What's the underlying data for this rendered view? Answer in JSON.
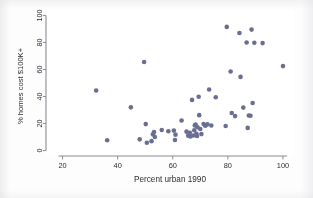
{
  "chart_data": {
    "type": "scatter",
    "title": "",
    "xlabel": "Percent urban 1990",
    "ylabel": "% homes cost $100K+",
    "xlim": [
      14,
      104
    ],
    "ylim": [
      -4,
      104
    ],
    "xticks": [
      20,
      40,
      60,
      80,
      100
    ],
    "yticks": [
      0,
      20,
      40,
      60,
      80,
      100
    ],
    "xtick_labels": [
      "20",
      "40",
      "60",
      "80",
      "100"
    ],
    "ytick_labels": [
      "0",
      "20",
      "40",
      "60",
      "80",
      "100"
    ],
    "grid": false,
    "legend": null,
    "marker": {
      "shape": "circle",
      "color": "#6a6e93",
      "size": 4.6
    },
    "axis_color": "#8c8c94",
    "points": [
      {
        "x": 32.2,
        "y": 44.5
      },
      {
        "x": 36.2,
        "y": 7.6
      },
      {
        "x": 44.8,
        "y": 32.0
      },
      {
        "x": 48.0,
        "y": 8.3
      },
      {
        "x": 49.6,
        "y": 65.5
      },
      {
        "x": 50.2,
        "y": 19.6
      },
      {
        "x": 50.6,
        "y": 5.8
      },
      {
        "x": 52.3,
        "y": 7.0
      },
      {
        "x": 52.8,
        "y": 12.0
      },
      {
        "x": 53.2,
        "y": 13.8
      },
      {
        "x": 53.5,
        "y": 10.0
      },
      {
        "x": 56.0,
        "y": 15.2
      },
      {
        "x": 58.4,
        "y": 14.3
      },
      {
        "x": 60.4,
        "y": 14.8
      },
      {
        "x": 60.8,
        "y": 7.8
      },
      {
        "x": 61.0,
        "y": 11.8
      },
      {
        "x": 63.2,
        "y": 22.3
      },
      {
        "x": 65.0,
        "y": 14.0
      },
      {
        "x": 65.6,
        "y": 11.0
      },
      {
        "x": 66.2,
        "y": 13.2
      },
      {
        "x": 66.4,
        "y": 10.4
      },
      {
        "x": 67.0,
        "y": 37.5
      },
      {
        "x": 67.4,
        "y": 11.2
      },
      {
        "x": 67.8,
        "y": 15.0
      },
      {
        "x": 68.0,
        "y": 18.6
      },
      {
        "x": 68.3,
        "y": 19.2
      },
      {
        "x": 68.6,
        "y": 12.4
      },
      {
        "x": 68.8,
        "y": 10.8
      },
      {
        "x": 69.0,
        "y": 17.3
      },
      {
        "x": 69.4,
        "y": 39.8
      },
      {
        "x": 69.6,
        "y": 26.2
      },
      {
        "x": 70.0,
        "y": 16.0
      },
      {
        "x": 70.4,
        "y": 12.2
      },
      {
        "x": 71.2,
        "y": 19.6
      },
      {
        "x": 71.8,
        "y": 18.4
      },
      {
        "x": 72.6,
        "y": 19.4
      },
      {
        "x": 73.2,
        "y": 45.2
      },
      {
        "x": 74.0,
        "y": 18.6
      },
      {
        "x": 75.6,
        "y": 39.5
      },
      {
        "x": 79.2,
        "y": 18.2
      },
      {
        "x": 79.6,
        "y": 91.5
      },
      {
        "x": 81.0,
        "y": 58.5
      },
      {
        "x": 81.4,
        "y": 27.8
      },
      {
        "x": 82.6,
        "y": 25.5
      },
      {
        "x": 84.2,
        "y": 87.0
      },
      {
        "x": 84.6,
        "y": 54.5
      },
      {
        "x": 85.6,
        "y": 31.8
      },
      {
        "x": 86.8,
        "y": 80.0
      },
      {
        "x": 87.2,
        "y": 16.8
      },
      {
        "x": 87.6,
        "y": 26.0
      },
      {
        "x": 88.2,
        "y": 25.8
      },
      {
        "x": 88.6,
        "y": 89.5
      },
      {
        "x": 89.0,
        "y": 35.2
      },
      {
        "x": 89.6,
        "y": 79.8
      },
      {
        "x": 92.6,
        "y": 79.5
      },
      {
        "x": 100.0,
        "y": 62.5
      }
    ]
  }
}
